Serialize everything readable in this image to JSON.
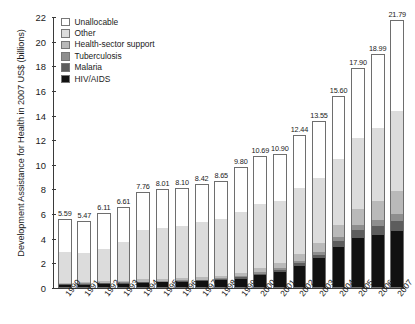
{
  "chart_data": {
    "type": "bar",
    "stacked": true,
    "title": "",
    "subtitle": "",
    "xlabel": "",
    "ylabel": "Development Assistance for Health in 2007 US$ (billions)",
    "ylim": [
      0,
      22
    ],
    "ytick_step": 2,
    "ytick_labels": [
      "0",
      "2",
      "4",
      "6",
      "8",
      "10",
      "12",
      "14",
      "16",
      "18",
      "20",
      "22"
    ],
    "grid": false,
    "legend_position": "top-left",
    "categories": [
      "1990",
      "1991",
      "1992",
      "1993",
      "1994",
      "1995",
      "1996",
      "1997",
      "1998",
      "1999",
      "2000",
      "2001",
      "2002",
      "2003",
      "2004",
      "2005",
      "2006",
      "2007"
    ],
    "totals": [
      5.59,
      5.47,
      6.11,
      6.61,
      7.76,
      8.01,
      8.1,
      8.42,
      8.65,
      9.8,
      10.69,
      10.9,
      12.44,
      13.55,
      15.6,
      17.9,
      18.99,
      21.79
    ],
    "total_labels": [
      "5.59",
      "5.47",
      "6.11",
      "6.61",
      "7.76",
      "8.01",
      "8.10",
      "8.42",
      "8.65",
      "9.80",
      "10.69",
      "10.90",
      "12.44",
      "13.55",
      "15.60",
      "17.90",
      "18.99",
      "21.79"
    ],
    "series": [
      {
        "name": "HIV/AIDS",
        "color": "#111111",
        "values": [
          0.18,
          0.21,
          0.25,
          0.27,
          0.33,
          0.38,
          0.42,
          0.47,
          0.55,
          0.7,
          0.95,
          1.25,
          1.75,
          2.35,
          3.3,
          4.05,
          4.3,
          4.6
        ]
      },
      {
        "name": "Malaria",
        "color": "#5d5d5d",
        "values": [
          0.05,
          0.05,
          0.06,
          0.06,
          0.07,
          0.07,
          0.08,
          0.08,
          0.09,
          0.11,
          0.14,
          0.18,
          0.24,
          0.32,
          0.45,
          0.62,
          0.7,
          0.8
        ]
      },
      {
        "name": "Tuberculosis",
        "color": "#8e8e8e",
        "values": [
          0.04,
          0.04,
          0.04,
          0.05,
          0.05,
          0.06,
          0.06,
          0.07,
          0.07,
          0.09,
          0.11,
          0.14,
          0.18,
          0.24,
          0.33,
          0.45,
          0.52,
          0.6
        ]
      },
      {
        "name": "Health-sector support",
        "color": "#b9b9b9",
        "values": [
          0.1,
          0.11,
          0.13,
          0.15,
          0.18,
          0.19,
          0.2,
          0.22,
          0.24,
          0.28,
          0.34,
          0.42,
          0.55,
          0.72,
          0.98,
          1.3,
          1.55,
          1.85
        ]
      },
      {
        "name": "Other",
        "color": "#dcdcdc",
        "values": [
          2.52,
          2.45,
          2.72,
          3.22,
          4.08,
          4.22,
          4.27,
          4.55,
          4.7,
          5.02,
          5.34,
          5.11,
          5.4,
          5.32,
          5.44,
          5.78,
          5.92,
          6.54
        ]
      },
      {
        "name": "Unallocable",
        "color": "#ffffff",
        "values": [
          2.7,
          2.61,
          2.91,
          2.86,
          3.05,
          3.09,
          3.07,
          3.03,
          3.0,
          3.6,
          3.81,
          3.8,
          4.32,
          4.6,
          5.1,
          5.7,
          6.0,
          7.4
        ]
      }
    ]
  },
  "legend": {
    "items": [
      {
        "label": "Unallocable",
        "color": "#ffffff"
      },
      {
        "label": "Other",
        "color": "#dcdcdc"
      },
      {
        "label": "Health-sector support",
        "color": "#b9b9b9"
      },
      {
        "label": "Tuberculosis",
        "color": "#8e8e8e"
      },
      {
        "label": "Malaria",
        "color": "#5d5d5d"
      },
      {
        "label": "HIV/AIDS",
        "color": "#111111"
      }
    ]
  }
}
